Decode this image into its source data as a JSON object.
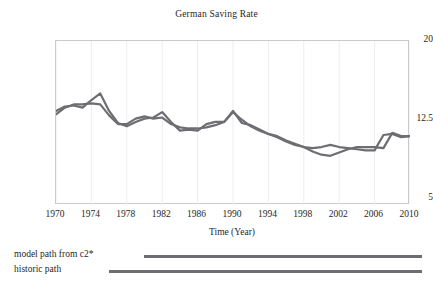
{
  "chart_data": {
    "type": "line",
    "title": "German Saving Rate",
    "xlabel": "Time (Year)",
    "ylabel": "",
    "xlim": [
      1970,
      2010
    ],
    "ylim": [
      5,
      20
    ],
    "xticks": [
      1970,
      1974,
      1978,
      1982,
      1986,
      1990,
      1994,
      1998,
      2002,
      2006,
      2010
    ],
    "yticks": [
      20,
      12.5,
      5
    ],
    "grid": true,
    "legend_position": "below-axes",
    "line_color": "#6e6e72",
    "x": [
      1970,
      1971,
      1972,
      1973,
      1974,
      1975,
      1976,
      1977,
      1978,
      1979,
      1980,
      1981,
      1982,
      1983,
      1984,
      1985,
      1986,
      1987,
      1988,
      1989,
      1990,
      1991,
      1992,
      1993,
      1994,
      1995,
      1996,
      1997,
      1998,
      1999,
      2000,
      2001,
      2002,
      2003,
      2004,
      2005,
      2006,
      2007,
      2008,
      2009,
      2010
    ],
    "series": [
      {
        "name": "model path from  c2*",
        "color": "#6e6e72",
        "values": [
          13.6,
          14.0,
          14.1,
          13.9,
          14.6,
          15.2,
          13.6,
          12.5,
          12.2,
          12.6,
          12.9,
          13.0,
          13.5,
          12.6,
          11.8,
          11.9,
          11.8,
          12.4,
          12.6,
          12.6,
          13.6,
          12.5,
          12.3,
          11.9,
          11.5,
          11.2,
          10.8,
          10.5,
          10.3,
          10.2,
          10.3,
          10.5,
          10.3,
          10.2,
          10.1,
          10.0,
          10.0,
          11.4,
          11.5,
          11.2,
          11.3
        ]
      },
      {
        "name": "historic path",
        "color": "#6e6e72",
        "values": [
          13.3,
          13.9,
          14.2,
          14.2,
          14.3,
          14.2,
          13.2,
          12.4,
          12.4,
          12.9,
          13.1,
          12.9,
          13.0,
          12.4,
          12.1,
          12.0,
          12.0,
          12.1,
          12.3,
          12.6,
          13.5,
          12.8,
          12.2,
          11.8,
          11.5,
          11.3,
          10.9,
          10.6,
          10.3,
          9.9,
          9.6,
          9.5,
          9.8,
          10.1,
          10.3,
          10.3,
          10.3,
          10.2,
          11.6,
          11.3,
          11.3
        ]
      }
    ]
  },
  "legend": {
    "items": [
      {
        "label": "model path from  c2*"
      },
      {
        "label": "historic path"
      }
    ]
  },
  "axes": {
    "x_title": "Time (Year)",
    "y_tick_labels": [
      "20",
      "12.5",
      "5"
    ],
    "x_tick_labels": [
      "1970",
      "1974",
      "1978",
      "1982",
      "1986",
      "1990",
      "1994",
      "1998",
      "2002",
      "2006",
      "2010"
    ]
  }
}
